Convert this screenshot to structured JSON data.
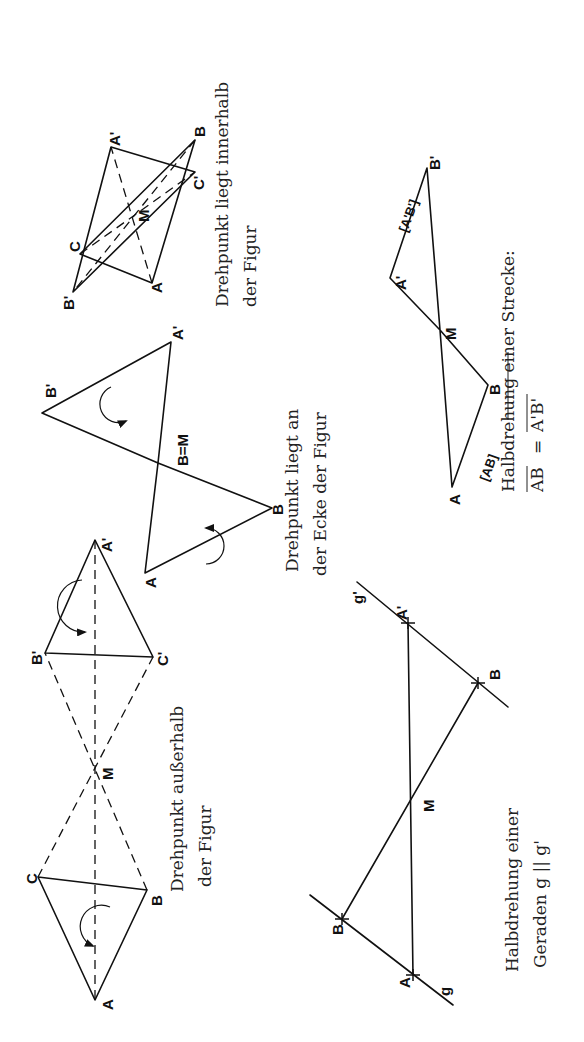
{
  "figures": [
    {
      "id": "inside",
      "caption_line1": "Drehpunkt liegt innerhalb",
      "caption_line2": "der Figur",
      "labels": {
        "A": "A",
        "B": "B",
        "C": "C",
        "A_prime": "A'",
        "B_prime": "B'",
        "C_prime": "C'",
        "M": "M"
      }
    },
    {
      "id": "vertex",
      "caption_line1": "Drehpunkt liegt an",
      "caption_line2": "der Ecke der Figur",
      "labels": {
        "A": "A",
        "B": "B",
        "A_prime": "A'",
        "B_prime": "B'",
        "BM": "B=M"
      }
    },
    {
      "id": "outside",
      "caption_line1": "Drehpunkt außerhalb",
      "caption_line2": "der Figur",
      "labels": {
        "A": "A",
        "B": "B",
        "C": "C",
        "A_prime": "A'",
        "B_prime": "B'",
        "C_prime": "C'",
        "M": "M"
      }
    },
    {
      "id": "segment",
      "caption_line1": "Halbdrehung einer Strecke:",
      "caption_line2_left": "AB",
      "caption_line2_eq": "=",
      "caption_line2_right": "A'B'",
      "labels": {
        "A": "A",
        "B": "B",
        "A_prime": "A'",
        "B_prime": "B'",
        "M": "M",
        "seg_AB": "[AB]",
        "seg_ApBp": "[A'B']"
      }
    },
    {
      "id": "line",
      "caption_line1": "Halbdrehung einer",
      "caption_line2": "Geraden g || g'",
      "labels": {
        "A": "A",
        "B": "B",
        "A_prime": "A'",
        "B_prime": "B'",
        "M": "M",
        "g": "g",
        "g_prime": "g'"
      }
    }
  ]
}
